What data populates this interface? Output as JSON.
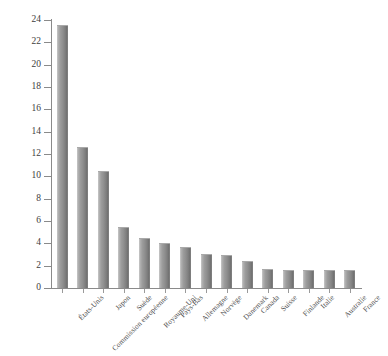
{
  "chart_data": {
    "type": "bar",
    "title": "",
    "xlabel": "",
    "ylabel": "",
    "ylim": [
      0,
      24
    ],
    "ytick_step": 2,
    "grid": false,
    "legend": "none",
    "categories": [
      "États-Unis",
      "Commission européenne",
      "Japon",
      "Suède",
      "Royaume-Uni",
      "Pays-Bas",
      "Allemagne",
      "Norvège",
      "Danemark",
      "Canada",
      "Suisse",
      "Finlande",
      "Italie",
      "Australie",
      "France"
    ],
    "values": [
      23.5,
      12.5,
      10.4,
      5.4,
      4.4,
      3.9,
      3.6,
      3.0,
      2.9,
      2.3,
      1.6,
      1.5,
      1.5,
      1.5,
      1.5
    ],
    "ytick_labels": [
      "0",
      "2",
      "4",
      "6",
      "8",
      "10",
      "12",
      "14",
      "16",
      "18",
      "20",
      "22",
      "24"
    ],
    "ytick_values": [
      0,
      2,
      4,
      6,
      8,
      10,
      12,
      14,
      16,
      18,
      20,
      22,
      24
    ],
    "bar_color_light": "#c9c9c9",
    "bar_color_dark": "#707070",
    "axis_color": "#8a8a8a",
    "background": "#ffffff"
  }
}
